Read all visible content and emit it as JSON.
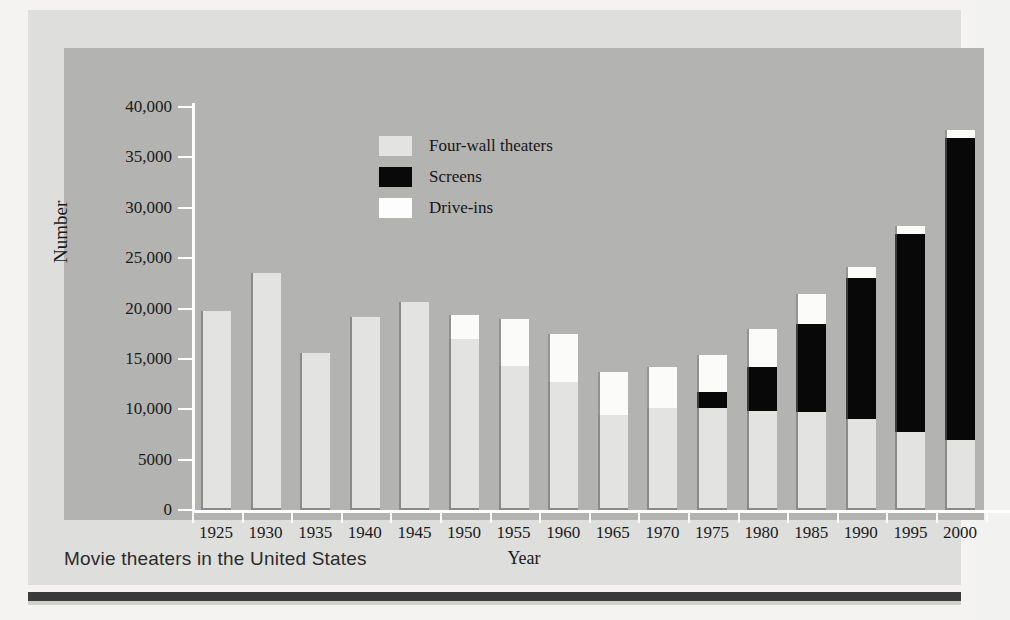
{
  "figure": {
    "top_cropped_text": "",
    "caption": "Movie theaters in the United States"
  },
  "colors": {
    "four_wall": "#e3e3e1",
    "screens": "#080808",
    "drive_ins": "#fbfbfa",
    "panel_bg": "#b3b3b1",
    "card_bg": "#dededc",
    "page_bg": "#f4f3f1",
    "axis": "#fdfdfd",
    "text": "#1a1a1a"
  },
  "chart_data": {
    "type": "bar",
    "stacked": true,
    "title": "Movie theaters in the United States",
    "xlabel": "Year",
    "ylabel": "Number",
    "ylim": [
      0,
      40000
    ],
    "grid": false,
    "legend_position": "inside-top-center",
    "ytick_labels": [
      "0",
      "5000",
      "10,000",
      "15,000",
      "20,000",
      "25,000",
      "30,000",
      "35,000",
      "40,000"
    ],
    "ytick_values": [
      0,
      5000,
      10000,
      15000,
      20000,
      25000,
      30000,
      35000,
      40000
    ],
    "categories": [
      "1925",
      "1930",
      "1935",
      "1940",
      "1945",
      "1950",
      "1955",
      "1960",
      "1965",
      "1970",
      "1975",
      "1980",
      "1985",
      "1990",
      "1995",
      "2000"
    ],
    "series": [
      {
        "name": "Four-wall theaters",
        "color": "#e3e3e1",
        "values": [
          19800,
          23500,
          15600,
          19200,
          20600,
          17000,
          14300,
          12700,
          9400,
          10100,
          10100,
          9800,
          9700,
          9000,
          7700,
          6900
        ]
      },
      {
        "name": "Screens",
        "color": "#080808",
        "values": [
          0,
          0,
          0,
          0,
          0,
          0,
          0,
          0,
          0,
          0,
          1600,
          4400,
          8800,
          14000,
          19700,
          30000
        ]
      },
      {
        "name": "Drive-ins",
        "color": "#fbfbfa",
        "values": [
          0,
          0,
          0,
          0,
          0,
          2400,
          4700,
          4800,
          4300,
          4100,
          3700,
          3800,
          2900,
          1100,
          800,
          800
        ]
      }
    ],
    "totals": [
      19800,
      23500,
      15600,
      19200,
      20600,
      19400,
      19000,
      17500,
      13700,
      14200,
      15400,
      18000,
      21400,
      24100,
      28200,
      37700
    ]
  },
  "legend": {
    "items": [
      {
        "label": "Four-wall theaters",
        "swatch": "four-wall-swatch"
      },
      {
        "label": "Screens",
        "swatch": "screens-swatch"
      },
      {
        "label": "Drive-ins",
        "swatch": "drive-ins-swatch"
      }
    ]
  }
}
